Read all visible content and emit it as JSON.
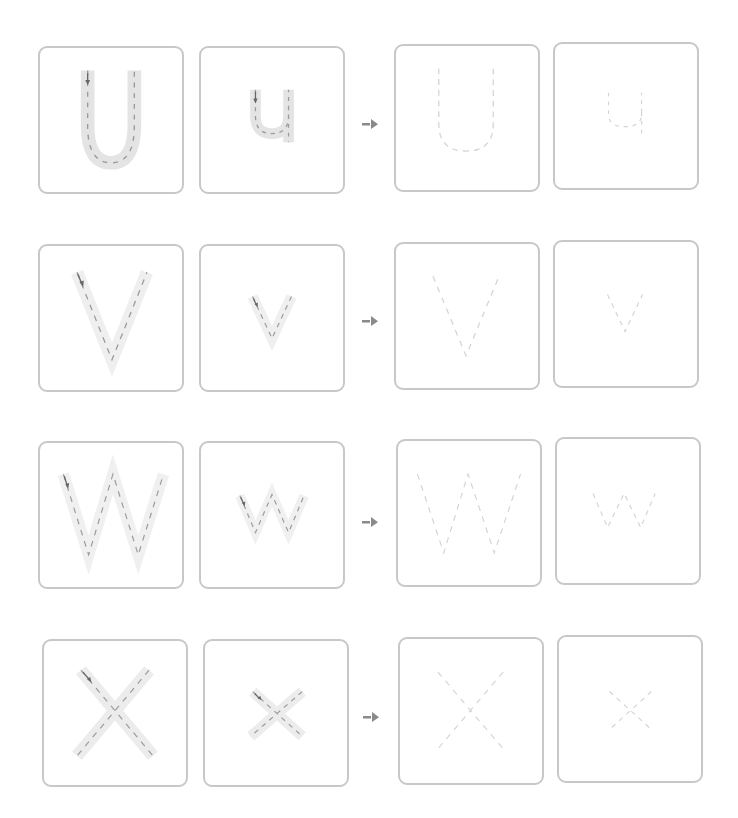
{
  "worksheet": {
    "colors": {
      "box_border": "#c8c8c8",
      "track_fill": "#e6e6e6",
      "guide_dash": "#9a9a9a",
      "trace_dash": "#d4d4d4",
      "arrow": "#8a8a8a"
    },
    "rows": [
      {
        "letter_upper": "U",
        "letter_lower": "u",
        "upper_label": "Trace uppercase U",
        "lower_label": "Trace lowercase u",
        "practice_upper_label": "Practice uppercase U",
        "practice_lower_label": "Practice lowercase u"
      },
      {
        "letter_upper": "V",
        "letter_lower": "v",
        "upper_label": "Trace uppercase V",
        "lower_label": "Trace lowercase v",
        "practice_upper_label": "Practice uppercase V",
        "practice_lower_label": "Practice lowercase v"
      },
      {
        "letter_upper": "W",
        "letter_lower": "w",
        "upper_label": "Trace uppercase W",
        "lower_label": "Trace lowercase w",
        "practice_upper_label": "Practice uppercase W",
        "practice_lower_label": "Practice lowercase w"
      },
      {
        "letter_upper": "X",
        "letter_lower": "x",
        "upper_label": "Trace uppercase X",
        "lower_label": "Trace lowercase x",
        "practice_upper_label": "Practice uppercase X",
        "practice_lower_label": "Practice lowercase x"
      }
    ],
    "arrow_icon": "right-arrow-icon"
  }
}
